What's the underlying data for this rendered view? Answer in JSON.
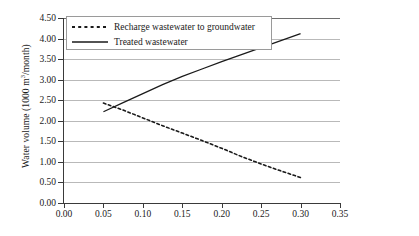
{
  "chart_data": {
    "type": "line",
    "title": "",
    "xlabel": "",
    "ylabel": "Water volume (1000 m3/month)",
    "ylabel_prefix": "Water volume (1000 m",
    "ylabel_sup": "3",
    "ylabel_suffix": "/month)",
    "xlim": [
      0.0,
      0.35
    ],
    "ylim": [
      0.0,
      4.5
    ],
    "xticks": [
      "0.00",
      "0.05",
      "0.10",
      "0.15",
      "0.20",
      "0.25",
      "0.30",
      "0.35"
    ],
    "xtick_values": [
      0.0,
      0.05,
      0.1,
      0.15,
      0.2,
      0.25,
      0.3,
      0.35
    ],
    "yticks": [
      "0.00",
      "0.50",
      "1.00",
      "1.50",
      "2.00",
      "2.50",
      "3.00",
      "3.50",
      "4.00",
      "4.50"
    ],
    "ytick_values": [
      0.0,
      0.5,
      1.0,
      1.5,
      2.0,
      2.5,
      3.0,
      3.5,
      4.0,
      4.5
    ],
    "grid": true,
    "grid_axis": "y",
    "legend_position": "top-left",
    "series": [
      {
        "name": "Recharge wastewater to groundwater",
        "style": "dashed",
        "color": "#1a1a1a",
        "x": [
          0.05,
          0.075,
          0.1,
          0.125,
          0.15,
          0.175,
          0.2,
          0.225,
          0.25,
          0.275,
          0.3
        ],
        "values": [
          2.43,
          2.26,
          2.07,
          1.88,
          1.7,
          1.52,
          1.33,
          1.13,
          0.95,
          0.78,
          0.62
        ]
      },
      {
        "name": "Treated wastewater",
        "style": "solid",
        "color": "#1a1a1a",
        "x": [
          0.05,
          0.075,
          0.1,
          0.125,
          0.15,
          0.175,
          0.2,
          0.225,
          0.25,
          0.275,
          0.3
        ],
        "values": [
          2.22,
          2.44,
          2.66,
          2.88,
          3.08,
          3.26,
          3.44,
          3.61,
          3.78,
          3.95,
          4.12
        ]
      }
    ]
  },
  "legend": {
    "items": [
      {
        "label": "Recharge wastewater to groundwater",
        "style": "dashed"
      },
      {
        "label": "Treated wastewater",
        "style": "solid"
      }
    ]
  }
}
